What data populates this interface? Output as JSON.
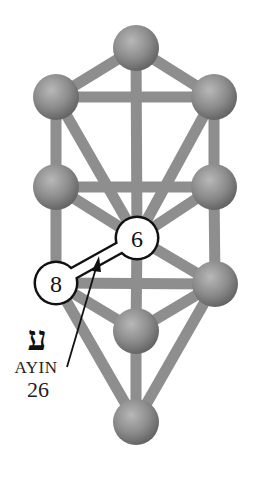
{
  "diagram": {
    "colors": {
      "background": "#ffffff",
      "sphere": "#8a8a8a",
      "sphere_highlight": "#b5b5b5",
      "sphere_shadow": "#5c5c5c",
      "path": "#8d8d8d",
      "highlight_fill": "#ffffff",
      "highlight_stroke": "#111111"
    },
    "spheres": [
      {
        "id": "kether",
        "x": 136,
        "y": 48
      },
      {
        "id": "binah",
        "x": 56,
        "y": 97
      },
      {
        "id": "chokmah",
        "x": 214,
        "y": 97
      },
      {
        "id": "geburah",
        "x": 56,
        "y": 187
      },
      {
        "id": "chesed",
        "x": 214,
        "y": 187
      },
      {
        "id": "tiphareth",
        "x": 137,
        "y": 238,
        "label": "6",
        "highlighted": true
      },
      {
        "id": "hod",
        "x": 56,
        "y": 283,
        "label": "8",
        "highlighted": true
      },
      {
        "id": "netzach",
        "x": 215,
        "y": 284
      },
      {
        "id": "yesod",
        "x": 136,
        "y": 331
      },
      {
        "id": "malkuth",
        "x": 136,
        "y": 422
      }
    ],
    "highlighted_path": {
      "from": "6",
      "to": "8",
      "letter_hebrew": "ע",
      "letter_name": "AYIN",
      "path_number": "26"
    }
  }
}
